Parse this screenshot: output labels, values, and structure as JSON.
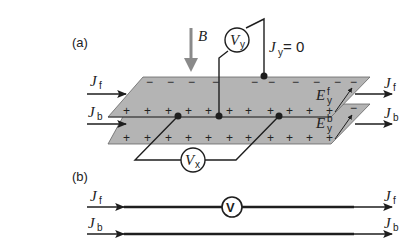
{
  "panel_a": {
    "label": "(a)",
    "field_label": "B",
    "voltmeter_y": {
      "symbol": "V",
      "sub": "y"
    },
    "voltmeter_x": {
      "symbol": "V",
      "sub": "x"
    },
    "current_condition": {
      "symbol": "J",
      "sub": "y",
      "rest": " = 0"
    },
    "front_current_in": {
      "symbol": "J",
      "sub": "f"
    },
    "back_current_in": {
      "symbol": "J",
      "sub": "b"
    },
    "front_current_out": {
      "symbol": "J",
      "sub": "f"
    },
    "back_current_out": {
      "symbol": "J",
      "sub": "b"
    },
    "field_front": {
      "symbol": "E",
      "sub": "y",
      "sup": "f"
    },
    "field_back": {
      "symbol": "E",
      "sub": "y",
      "sup": "b"
    },
    "top_plane_signs_negative": "−",
    "plane_signs_positive": "+"
  },
  "panel_b": {
    "label": "(b)",
    "front_current_in": {
      "symbol": "J",
      "sub": "f"
    },
    "back_current_in": {
      "symbol": "J",
      "sub": "b"
    },
    "front_current_out": {
      "symbol": "J",
      "sub": "f"
    },
    "back_current_out": {
      "symbol": "J",
      "sub": "b"
    },
    "voltmeter": "V"
  },
  "colors": {
    "plane_fill": "#b4b4b4",
    "line": "#1e1e1e",
    "b_arrow": "#8a8a8a"
  }
}
